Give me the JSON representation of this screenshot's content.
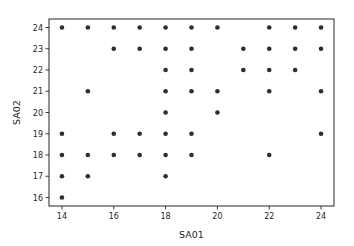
{
  "chart_data": {
    "type": "scatter",
    "title": "",
    "xlabel": "SA01",
    "ylabel": "SA02",
    "xlim": [
      13.5,
      24.5
    ],
    "ylim": [
      15.6,
      24.4
    ],
    "xticks": [
      14,
      16,
      18,
      20,
      22,
      24
    ],
    "yticks": [
      16,
      17,
      18,
      19,
      20,
      21,
      22,
      23,
      24
    ],
    "grid": false,
    "legend": null,
    "marker_color": "#2e2e2e",
    "marker_radius": 2.3,
    "points": [
      [
        14,
        24
      ],
      [
        15,
        24
      ],
      [
        16,
        24
      ],
      [
        17,
        24
      ],
      [
        18,
        24
      ],
      [
        19,
        24
      ],
      [
        20,
        24
      ],
      [
        22,
        24
      ],
      [
        23,
        24
      ],
      [
        24,
        24
      ],
      [
        16,
        23
      ],
      [
        17,
        23
      ],
      [
        18,
        23
      ],
      [
        19,
        23
      ],
      [
        21,
        23
      ],
      [
        22,
        23
      ],
      [
        23,
        23
      ],
      [
        24,
        23
      ],
      [
        18,
        22
      ],
      [
        19,
        22
      ],
      [
        21,
        22
      ],
      [
        22,
        22
      ],
      [
        23,
        22
      ],
      [
        15,
        21
      ],
      [
        18,
        21
      ],
      [
        19,
        21
      ],
      [
        20,
        21
      ],
      [
        22,
        21
      ],
      [
        24,
        21
      ],
      [
        18,
        20
      ],
      [
        20,
        20
      ],
      [
        14,
        19
      ],
      [
        16,
        19
      ],
      [
        17,
        19
      ],
      [
        18,
        19
      ],
      [
        19,
        19
      ],
      [
        24,
        19
      ],
      [
        14,
        18
      ],
      [
        15,
        18
      ],
      [
        16,
        18
      ],
      [
        17,
        18
      ],
      [
        18,
        18
      ],
      [
        19,
        18
      ],
      [
        22,
        18
      ],
      [
        14,
        17
      ],
      [
        15,
        17
      ],
      [
        18,
        17
      ],
      [
        14,
        16
      ]
    ]
  }
}
